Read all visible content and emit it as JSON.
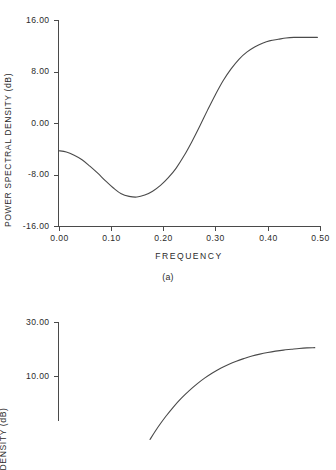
{
  "figure": {
    "background": "#ffffff",
    "line_color": "#4a4a4a",
    "text_color": "#2b2b2b"
  },
  "panel_a": {
    "caption": "(a)",
    "ylabel": "POWER SPECTRAL DENSITY (dB)",
    "xlabel": "FREQUENCY",
    "ytick_labels": [
      "16.00",
      "8.00",
      "0.00",
      "-8.00",
      "-16.00"
    ],
    "xtick_labels": [
      "0.00",
      "0.10",
      "0.20",
      "0.30",
      "0.40",
      "0.50"
    ]
  },
  "panel_b": {
    "ylabel": "DENSITY (dB)",
    "ytick_labels": [
      "30.00",
      "10.00"
    ]
  },
  "chart_data": [
    {
      "type": "line",
      "title": "",
      "caption": "(a)",
      "xlabel": "FREQUENCY",
      "ylabel": "POWER SPECTRAL DENSITY (dB)",
      "xlim": [
        0.0,
        0.5
      ],
      "ylim": [
        -16.0,
        16.0
      ],
      "xticks": [
        0.0,
        0.1,
        0.2,
        0.3,
        0.4,
        0.5
      ],
      "yticks": [
        -16.0,
        -8.0,
        0.0,
        8.0,
        16.0
      ],
      "grid": false,
      "legend": "none",
      "series": [
        {
          "name": "power spectral density",
          "x": [
            0.0,
            0.015,
            0.03,
            0.045,
            0.06,
            0.075,
            0.09,
            0.105,
            0.12,
            0.135,
            0.15,
            0.165,
            0.18,
            0.195,
            0.21,
            0.225,
            0.24,
            0.255,
            0.27,
            0.285,
            0.3,
            0.315,
            0.33,
            0.345,
            0.36,
            0.375,
            0.39,
            0.405,
            0.42,
            0.435,
            0.45,
            0.465,
            0.48,
            0.495
          ],
          "y": [
            -4.3,
            -4.5,
            -5.0,
            -5.7,
            -6.7,
            -7.8,
            -9.0,
            -10.1,
            -11.0,
            -11.4,
            -11.5,
            -11.2,
            -10.6,
            -9.7,
            -8.5,
            -7.0,
            -5.1,
            -2.9,
            -0.5,
            2.0,
            4.4,
            6.6,
            8.4,
            9.9,
            11.0,
            11.8,
            12.4,
            12.8,
            13.0,
            13.2,
            13.3,
            13.3,
            13.3,
            13.3
          ]
        }
      ]
    },
    {
      "type": "line",
      "title": "",
      "caption": "",
      "xlabel": "",
      "ylabel": "DENSITY (dB)",
      "xlim": [
        0.0,
        0.5
      ],
      "ylim": [
        -14.0,
        34.0
      ],
      "xticks": [],
      "yticks": [
        10.0,
        30.0
      ],
      "grid": false,
      "legend": "none",
      "series": [
        {
          "name": "power spectral density",
          "x": [
            0.175,
            0.19,
            0.205,
            0.22,
            0.235,
            0.25,
            0.265,
            0.28,
            0.295,
            0.31,
            0.325,
            0.34,
            0.355,
            0.37,
            0.385,
            0.4,
            0.415,
            0.43,
            0.445,
            0.46,
            0.475,
            0.49
          ],
          "y": [
            -13.5,
            -9.0,
            -5.0,
            -1.4,
            1.8,
            4.6,
            7.1,
            9.3,
            11.2,
            12.9,
            14.3,
            15.5,
            16.5,
            17.4,
            18.1,
            18.7,
            19.2,
            19.6,
            19.9,
            20.2,
            20.4,
            20.5
          ]
        }
      ]
    }
  ]
}
